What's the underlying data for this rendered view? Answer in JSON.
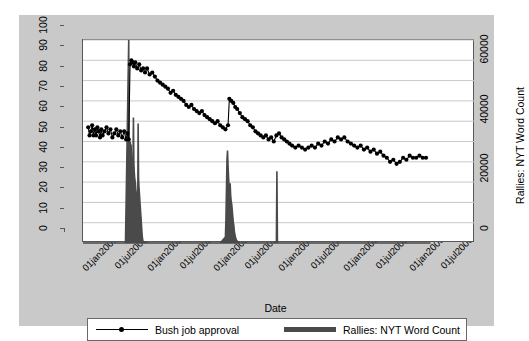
{
  "chart_data": {
    "type": "line",
    "title": "",
    "xlabel": "Date",
    "ylabel": "Bush job approval",
    "y2label": "Rallies: NYT Word Count",
    "grid": "horizontal",
    "legend_position": "bottom",
    "xlim": [
      "01jan2001",
      "01jan2007"
    ],
    "xticklabels": [
      "01jan2001",
      "01jul2001",
      "01jan2002",
      "01jul2002",
      "01jan2003",
      "01jul2003",
      "01jan2004",
      "01jul2004",
      "01jan2005",
      "01jul2005",
      "01jan2006",
      "01jul2006"
    ],
    "ylim": [
      0,
      100
    ],
    "yticklabels": [
      "0",
      "10",
      "20",
      "30",
      "40",
      "50",
      "60",
      "70",
      "80",
      "90",
      "100"
    ],
    "y2lim": [
      0,
      68000
    ],
    "y2ticklabels": [
      "0",
      "20000",
      "40000",
      "60000"
    ],
    "y2tickvalues": [
      0,
      20000,
      40000,
      60000
    ],
    "series": [
      {
        "name": "Bush job approval",
        "type": "line-markers",
        "axis": "left",
        "color": "#000000",
        "points": [
          [
            2001.08,
            57
          ],
          [
            2001.1,
            53
          ],
          [
            2001.12,
            55
          ],
          [
            2001.14,
            58
          ],
          [
            2001.16,
            53
          ],
          [
            2001.18,
            56
          ],
          [
            2001.2,
            53
          ],
          [
            2001.22,
            57
          ],
          [
            2001.24,
            55
          ],
          [
            2001.26,
            52
          ],
          [
            2001.28,
            56
          ],
          [
            2001.3,
            53
          ],
          [
            2001.33,
            55
          ],
          [
            2001.36,
            57
          ],
          [
            2001.39,
            54
          ],
          [
            2001.42,
            56
          ],
          [
            2001.45,
            52
          ],
          [
            2001.48,
            54
          ],
          [
            2001.51,
            56
          ],
          [
            2001.54,
            53
          ],
          [
            2001.57,
            55
          ],
          [
            2001.6,
            52
          ],
          [
            2001.63,
            55
          ],
          [
            2001.66,
            51
          ],
          [
            2001.68,
            54
          ],
          [
            2001.7,
            51
          ],
          [
            2001.72,
            88
          ],
          [
            2001.74,
            90
          ],
          [
            2001.76,
            89
          ],
          [
            2001.78,
            87
          ],
          [
            2001.8,
            89
          ],
          [
            2001.83,
            86
          ],
          [
            2001.86,
            88
          ],
          [
            2001.89,
            85
          ],
          [
            2001.92,
            86
          ],
          [
            2001.95,
            84
          ],
          [
            2001.98,
            86
          ],
          [
            2002.02,
            83
          ],
          [
            2002.06,
            84
          ],
          [
            2002.1,
            82
          ],
          [
            2002.14,
            80
          ],
          [
            2002.18,
            79
          ],
          [
            2002.22,
            78
          ],
          [
            2002.26,
            77
          ],
          [
            2002.3,
            76
          ],
          [
            2002.34,
            74
          ],
          [
            2002.38,
            75
          ],
          [
            2002.42,
            73
          ],
          [
            2002.46,
            72
          ],
          [
            2002.5,
            71
          ],
          [
            2002.54,
            70
          ],
          [
            2002.58,
            68
          ],
          [
            2002.62,
            67
          ],
          [
            2002.66,
            68
          ],
          [
            2002.7,
            66
          ],
          [
            2002.74,
            65
          ],
          [
            2002.78,
            64
          ],
          [
            2002.82,
            65
          ],
          [
            2002.86,
            63
          ],
          [
            2002.9,
            62
          ],
          [
            2002.94,
            61
          ],
          [
            2002.98,
            60
          ],
          [
            2003.02,
            59
          ],
          [
            2003.06,
            60
          ],
          [
            2003.1,
            58
          ],
          [
            2003.14,
            57
          ],
          [
            2003.18,
            56
          ],
          [
            2003.22,
            58
          ],
          [
            2003.24,
            71
          ],
          [
            2003.27,
            70
          ],
          [
            2003.3,
            69
          ],
          [
            2003.33,
            67
          ],
          [
            2003.36,
            66
          ],
          [
            2003.4,
            64
          ],
          [
            2003.44,
            62
          ],
          [
            2003.48,
            61
          ],
          [
            2003.52,
            60
          ],
          [
            2003.56,
            58
          ],
          [
            2003.6,
            57
          ],
          [
            2003.64,
            55
          ],
          [
            2003.68,
            54
          ],
          [
            2003.72,
            53
          ],
          [
            2003.76,
            52
          ],
          [
            2003.8,
            53
          ],
          [
            2003.84,
            51
          ],
          [
            2003.88,
            52
          ],
          [
            2003.92,
            50
          ],
          [
            2003.96,
            53
          ],
          [
            2004.0,
            54
          ],
          [
            2004.04,
            52
          ],
          [
            2004.08,
            51
          ],
          [
            2004.12,
            50
          ],
          [
            2004.16,
            49
          ],
          [
            2004.2,
            48
          ],
          [
            2004.25,
            47
          ],
          [
            2004.3,
            48
          ],
          [
            2004.35,
            47
          ],
          [
            2004.4,
            46
          ],
          [
            2004.45,
            47
          ],
          [
            2004.5,
            48
          ],
          [
            2004.55,
            47
          ],
          [
            2004.6,
            49
          ],
          [
            2004.65,
            48
          ],
          [
            2004.7,
            50
          ],
          [
            2004.75,
            49
          ],
          [
            2004.8,
            51
          ],
          [
            2004.85,
            50
          ],
          [
            2004.9,
            52
          ],
          [
            2004.95,
            51
          ],
          [
            2005.0,
            52
          ],
          [
            2005.05,
            50
          ],
          [
            2005.1,
            49
          ],
          [
            2005.15,
            48
          ],
          [
            2005.2,
            47
          ],
          [
            2005.25,
            48
          ],
          [
            2005.3,
            46
          ],
          [
            2005.35,
            47
          ],
          [
            2005.4,
            45
          ],
          [
            2005.45,
            46
          ],
          [
            2005.5,
            44
          ],
          [
            2005.55,
            45
          ],
          [
            2005.6,
            43
          ],
          [
            2005.65,
            42
          ],
          [
            2005.7,
            40
          ],
          [
            2005.75,
            41
          ],
          [
            2005.8,
            39
          ],
          [
            2005.85,
            40
          ],
          [
            2005.9,
            42
          ],
          [
            2005.95,
            41
          ],
          [
            2006.0,
            43
          ],
          [
            2006.05,
            42
          ],
          [
            2006.1,
            42
          ],
          [
            2006.15,
            43
          ],
          [
            2006.2,
            42
          ],
          [
            2006.25,
            42
          ]
        ]
      },
      {
        "name": "Rallies: NYT Word Count",
        "type": "spike",
        "axis": "right",
        "color": "#4a4a4a",
        "points": [
          [
            2001.0,
            0
          ],
          [
            2001.1,
            0
          ],
          [
            2001.2,
            0
          ],
          [
            2001.3,
            0
          ],
          [
            2001.4,
            0
          ],
          [
            2001.5,
            0
          ],
          [
            2001.6,
            0
          ],
          [
            2001.65,
            0
          ],
          [
            2001.7,
            68000
          ],
          [
            2001.706,
            17000
          ],
          [
            2001.712,
            24000
          ],
          [
            2001.718,
            31000
          ],
          [
            2001.724,
            34000
          ],
          [
            2001.73,
            30000
          ],
          [
            2001.736,
            33000
          ],
          [
            2001.742,
            28000
          ],
          [
            2001.748,
            26000
          ],
          [
            2001.754,
            27000
          ],
          [
            2001.76,
            24000
          ],
          [
            2001.766,
            29000
          ],
          [
            2001.772,
            42000
          ],
          [
            2001.778,
            27000
          ],
          [
            2001.784,
            24000
          ],
          [
            2001.79,
            22000
          ],
          [
            2001.796,
            21000
          ],
          [
            2001.802,
            20000
          ],
          [
            2001.808,
            18000
          ],
          [
            2001.814,
            17000
          ],
          [
            2001.82,
            16000
          ],
          [
            2001.826,
            15000
          ],
          [
            2001.832,
            14000
          ],
          [
            2001.838,
            13000
          ],
          [
            2001.844,
            40000
          ],
          [
            2001.85,
            22000
          ],
          [
            2001.856,
            19000
          ],
          [
            2001.862,
            17000
          ],
          [
            2001.868,
            15000
          ],
          [
            2001.874,
            13000
          ],
          [
            2001.88,
            11000
          ],
          [
            2001.886,
            9000
          ],
          [
            2001.892,
            7000
          ],
          [
            2001.898,
            5000
          ],
          [
            2001.904,
            3000
          ],
          [
            2001.91,
            1500
          ],
          [
            2001.92,
            500
          ],
          [
            2002.0,
            0
          ],
          [
            2002.2,
            0
          ],
          [
            2002.4,
            0
          ],
          [
            2002.6,
            0
          ],
          [
            2002.8,
            0
          ],
          [
            2003.0,
            0
          ],
          [
            2003.1,
            0
          ],
          [
            2003.18,
            2000
          ],
          [
            2003.188,
            8000
          ],
          [
            2003.196,
            18000
          ],
          [
            2003.204,
            28000
          ],
          [
            2003.212,
            31000
          ],
          [
            2003.22,
            26000
          ],
          [
            2003.228,
            22000
          ],
          [
            2003.236,
            19000
          ],
          [
            2003.244,
            18000
          ],
          [
            2003.252,
            20000
          ],
          [
            2003.26,
            16000
          ],
          [
            2003.268,
            14000
          ],
          [
            2003.276,
            13000
          ],
          [
            2003.284,
            11000
          ],
          [
            2003.292,
            9000
          ],
          [
            2003.3,
            7000
          ],
          [
            2003.308,
            6000
          ],
          [
            2003.316,
            4000
          ],
          [
            2003.324,
            3000
          ],
          [
            2003.332,
            2000
          ],
          [
            2003.35,
            800
          ],
          [
            2003.4,
            0
          ],
          [
            2003.6,
            0
          ],
          [
            2003.8,
            0
          ],
          [
            2003.96,
            0
          ],
          [
            2003.968,
            24000
          ],
          [
            2003.976,
            0
          ],
          [
            2004.1,
            0
          ],
          [
            2004.4,
            0
          ],
          [
            2004.7,
            0
          ],
          [
            2005.0,
            0
          ],
          [
            2005.3,
            0
          ],
          [
            2005.6,
            0
          ],
          [
            2005.9,
            0
          ],
          [
            2006.2,
            0
          ],
          [
            2006.32,
            0
          ]
        ]
      }
    ]
  },
  "axes": {
    "x": {
      "title": "Date",
      "ticks": [
        "01jan2001",
        "01jul2001",
        "01jan2002",
        "01jul2002",
        "01jan2003",
        "01jul2003",
        "01jan2004",
        "01jul2004",
        "01jan2005",
        "01jul2005",
        "01jan2006",
        "01jul2006"
      ]
    },
    "y_left": {
      "title": "Bush job approval",
      "ticks": [
        "0",
        "10",
        "20",
        "30",
        "40",
        "50",
        "60",
        "70",
        "80",
        "90",
        "100"
      ]
    },
    "y_right": {
      "title": "Rallies: NYT Word Count",
      "ticks": [
        "0",
        "20000",
        "40000",
        "60000"
      ]
    }
  },
  "legend": {
    "entries": [
      {
        "label": "Bush job approval",
        "key": "line-marker-key",
        "color": "#000000"
      },
      {
        "label": "Rallies: NYT Word Count",
        "key": "thick-line-key",
        "color": "#4a4a4a"
      }
    ]
  },
  "colors": {
    "background": "#c9c9c9",
    "plot_background": "#ffffff",
    "gridline": "#c9c9c9",
    "approval_line": "#000000",
    "rallies_bars": "#4a4a4a",
    "frame": "#585858"
  }
}
